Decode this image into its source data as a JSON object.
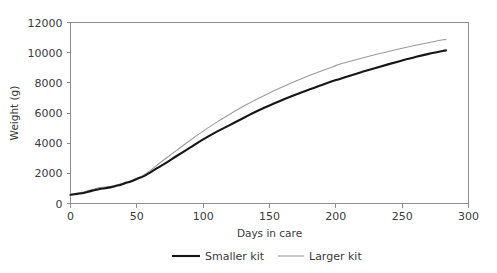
{
  "chart_data": {
    "type": "line",
    "title": "",
    "xlabel": "Days in care",
    "ylabel": "Weight (g)",
    "xlim": [
      0,
      300
    ],
    "ylim": [
      0,
      12000
    ],
    "xticks": [
      0,
      50,
      100,
      150,
      200,
      250,
      300
    ],
    "yticks": [
      0,
      2000,
      4000,
      6000,
      8000,
      10000,
      12000
    ],
    "xtick_labels": [
      "0",
      "50",
      "100",
      "150",
      "200",
      "250",
      "300"
    ],
    "ytick_labels": [
      "0",
      "2000",
      "4000",
      "6000",
      "8000",
      "10000",
      "12000"
    ],
    "grid": false,
    "legend_position": "bottom",
    "series": [
      {
        "name": "Smaller kit",
        "color": "#161616",
        "width": 2.1,
        "x": [
          0,
          5,
          10,
          14,
          18,
          22,
          26,
          30,
          34,
          38,
          42,
          46,
          50,
          55,
          60,
          66,
          72,
          80,
          90,
          100,
          110,
          120,
          130,
          140,
          150,
          160,
          170,
          180,
          190,
          200,
          210,
          220,
          230,
          240,
          250,
          260,
          270,
          283
        ],
        "y": [
          580,
          640,
          700,
          790,
          880,
          960,
          1010,
          1070,
          1160,
          1250,
          1370,
          1480,
          1630,
          1800,
          2050,
          2380,
          2700,
          3150,
          3700,
          4250,
          4750,
          5200,
          5650,
          6100,
          6500,
          6880,
          7230,
          7560,
          7880,
          8180,
          8460,
          8730,
          8990,
          9240,
          9480,
          9710,
          9920,
          10150
        ]
      },
      {
        "name": "Larger kit",
        "color": "#9b9b9b",
        "width": 1.1,
        "x": [
          0,
          5,
          10,
          14,
          18,
          22,
          26,
          30,
          34,
          38,
          42,
          46,
          50,
          55,
          60,
          66,
          72,
          80,
          90,
          100,
          110,
          120,
          130,
          140,
          150,
          160,
          170,
          180,
          190,
          200,
          205,
          215,
          225,
          235,
          245,
          255,
          265,
          275,
          283
        ],
        "y": [
          600,
          680,
          760,
          870,
          960,
          1060,
          1090,
          1130,
          1210,
          1300,
          1420,
          1530,
          1680,
          1880,
          2180,
          2600,
          3000,
          3520,
          4180,
          4800,
          5380,
          5920,
          6430,
          6900,
          7330,
          7740,
          8120,
          8480,
          8820,
          9140,
          9300,
          9530,
          9760,
          9980,
          10190,
          10390,
          10580,
          10760,
          10880
        ]
      }
    ]
  },
  "legend": {
    "items": [
      {
        "label": "Smaller kit"
      },
      {
        "label": "Larger kit"
      }
    ]
  }
}
